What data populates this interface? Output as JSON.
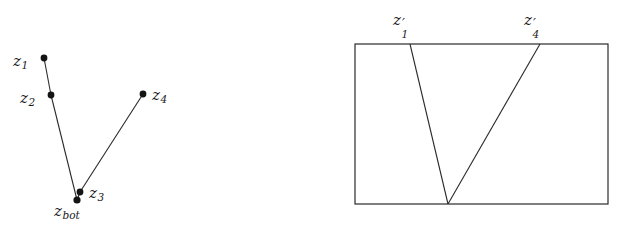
{
  "figure": {
    "caption": "",
    "background_color": "#ffffff",
    "stroke_color": "#2a2a2a",
    "label_color": "#1a1a1a",
    "width": 621,
    "height": 236
  },
  "left_diagram": {
    "name": "polyline-path-diagram",
    "points": [
      {
        "id": "z1",
        "label_base": "z",
        "label_sub": "1",
        "x": 44,
        "y": 58,
        "label_x": 13,
        "label_y": 54,
        "label_side": "left"
      },
      {
        "id": "z2",
        "label_base": "z",
        "label_sub": "2",
        "x": 51,
        "y": 95,
        "label_x": 20,
        "label_y": 91,
        "label_side": "left"
      },
      {
        "id": "zbot",
        "label_base": "z",
        "label_sub": "bot",
        "x": 77,
        "y": 200,
        "label_x": 54,
        "label_y": 204,
        "label_side": "below"
      },
      {
        "id": "z3",
        "label_base": "z",
        "label_sub": "3",
        "x": 80,
        "y": 192,
        "label_x": 89,
        "label_y": 186,
        "label_side": "right"
      },
      {
        "id": "z4",
        "label_base": "z",
        "label_sub": "4",
        "x": 143,
        "y": 94,
        "label_x": 152,
        "label_y": 88,
        "label_side": "right"
      }
    ],
    "segments": [
      {
        "from": "z1",
        "to": "z2"
      },
      {
        "from": "z2",
        "to": "zbot"
      },
      {
        "from": "zbot",
        "to": "z3"
      },
      {
        "from": "z3",
        "to": "z4"
      }
    ],
    "dot_radius": 3.4
  },
  "right_diagram": {
    "name": "rectangle-vshape-diagram",
    "rectangle": {
      "x": 355,
      "y": 44,
      "width": 253,
      "height": 160
    },
    "vertices": [
      {
        "id": "z1prime",
        "label_base": "z",
        "label_sub": "1",
        "prime": "′",
        "x": 410,
        "y": 44,
        "label_x": 393,
        "label_y": 13
      },
      {
        "id": "vbottom",
        "label_base": "",
        "label_sub": "",
        "prime": "",
        "x": 448,
        "y": 204,
        "label_x": 0,
        "label_y": 0
      },
      {
        "id": "z4prime",
        "label_base": "z",
        "label_sub": "4",
        "prime": "′",
        "x": 540,
        "y": 44,
        "label_x": 524,
        "label_y": 13
      }
    ],
    "segments": [
      {
        "from": "z1prime",
        "to": "vbottom"
      },
      {
        "from": "vbottom",
        "to": "z4prime"
      }
    ]
  }
}
